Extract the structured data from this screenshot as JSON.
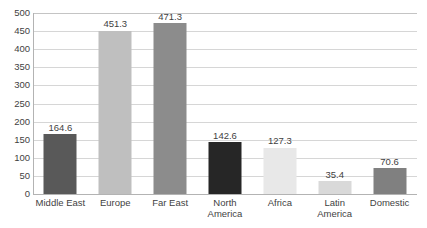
{
  "chart_data": {
    "type": "bar",
    "title": "",
    "xlabel": "",
    "ylabel": "",
    "ylim": [
      0,
      500
    ],
    "ytick_step": 50,
    "yticks": [
      "500",
      "450",
      "400",
      "350",
      "300",
      "250",
      "200",
      "150",
      "100",
      "50",
      "0"
    ],
    "grid": true,
    "legend": "none",
    "categories": [
      "Middle East",
      "Europe",
      "Far East",
      "North America",
      "Africa",
      "Latin America",
      "Domestic"
    ],
    "values": [
      164.6,
      451.3,
      471.3,
      142.6,
      127.3,
      35.4,
      70.6
    ],
    "value_labels": [
      "164.6",
      "451.3",
      "471.3",
      "142.6",
      "127.3",
      "35.4",
      "70.6"
    ],
    "bar_colors": [
      "#595959",
      "#bfbfbf",
      "#8c8c8c",
      "#262626",
      "#e8e8e8",
      "#d9d9d9",
      "#808080"
    ]
  },
  "style": {
    "background": "#ffffff",
    "gridline_color": "#d6d6d6",
    "axis_color": "#b3b3b3",
    "text_color": "#3f3f3f"
  }
}
